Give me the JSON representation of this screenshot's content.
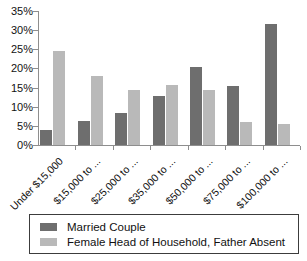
{
  "chart_data": {
    "type": "bar",
    "title": "",
    "xlabel": "",
    "ylabel": "",
    "ylim": [
      0,
      35
    ],
    "grid": false,
    "legend_position": "bottom",
    "y_tick_labels": [
      "0%",
      "5%",
      "10%",
      "15%",
      "20%",
      "25%",
      "30%",
      "35%"
    ],
    "y_tick_values": [
      0,
      5,
      10,
      15,
      20,
      25,
      30,
      35
    ],
    "categories": [
      "Under $15,000",
      "$15,000 to ...",
      "$25,000 to ...",
      "$35,000 to ...",
      "$50,000 to ...",
      "$75,000 to ...",
      "$100,000 to ..."
    ],
    "series": [
      {
        "name": "Married Couple",
        "color": "#6e6e6e",
        "values": [
          4.0,
          6.2,
          8.4,
          12.7,
          20.3,
          15.4,
          31.7
        ]
      },
      {
        "name": "Female Head of Household, Father Absent",
        "color": "#b9b9b9",
        "values": [
          24.6,
          17.9,
          14.3,
          15.8,
          14.3,
          6.0,
          5.5
        ]
      }
    ]
  },
  "legend": {
    "items": [
      {
        "label": "Married Couple",
        "color": "#6e6e6e"
      },
      {
        "label": "Female Head of Household, Father Absent",
        "color": "#b9b9b9"
      }
    ]
  },
  "axis": {
    "y_max_label": "35%",
    "y_min_label": "0%"
  }
}
